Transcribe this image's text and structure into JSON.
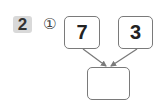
{
  "problem": {
    "number": "2",
    "sub_number": "①"
  },
  "diagram": {
    "left_box": "7",
    "right_box": "3",
    "result_box": ""
  },
  "colors": {
    "badge_bg": "#d9d9d9",
    "box_border": "#7a7a7a",
    "arrow": "#7a7a7a"
  }
}
